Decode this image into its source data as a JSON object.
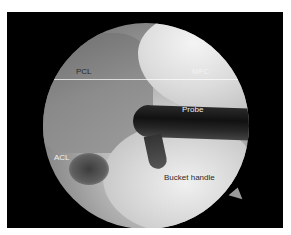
{
  "figure": {
    "type": "arthroscopic-view",
    "labels": {
      "pcl": "PCL",
      "mfc": "MFC",
      "probe": "Probe",
      "acl": "ACL",
      "bucket_handle": "Bucket handle"
    },
    "colors": {
      "frame": "#000000",
      "background": "#ffffff"
    }
  }
}
